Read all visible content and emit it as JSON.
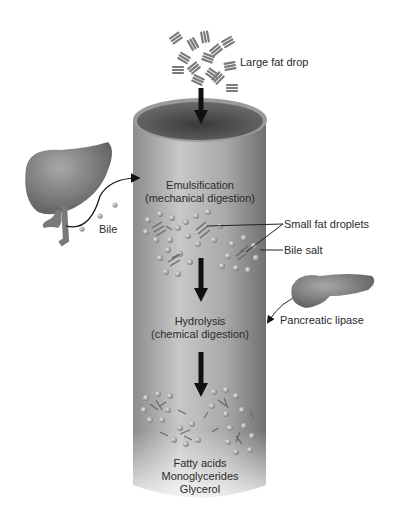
{
  "diagram": {
    "colors": {
      "tube_light": "#c4c4c4",
      "tube_dark": "#6e6e6e",
      "organ": "#8a8a8a",
      "arrow": "#111111",
      "text": "#2a2a2a"
    },
    "labels": {
      "large_fat_drop": "Large fat drop",
      "emulsification_line1": "Emulsification",
      "emulsification_line2": "(mechanical digestion)",
      "bile": "Bile",
      "small_fat_droplets": "Small fat droplets",
      "bile_salt": "Bile salt",
      "pancreatic_lipase": "Pancreatic lipase",
      "hydrolysis_line1": "Hydrolysis",
      "hydrolysis_line2": "(chemical digestion)",
      "products": [
        "Fatty acids",
        "Monoglycerides",
        "Glycerol"
      ]
    },
    "nodes": [
      {
        "id": "large-fat-drop",
        "label": "Large fat drop"
      },
      {
        "id": "liver",
        "label": "Liver (source of bile)"
      },
      {
        "id": "emulsification",
        "label": "Emulsification (mechanical digestion)"
      },
      {
        "id": "small-fat-droplets",
        "label": "Small fat droplets"
      },
      {
        "id": "pancreas",
        "label": "Pancreatic lipase"
      },
      {
        "id": "hydrolysis",
        "label": "Hydrolysis (chemical digestion)"
      },
      {
        "id": "products",
        "label": "Fatty acids, Monoglycerides, Glycerol"
      }
    ],
    "edges": [
      {
        "from": "large-fat-drop",
        "to": "emulsification"
      },
      {
        "from": "liver",
        "to": "emulsification",
        "label": "Bile"
      },
      {
        "from": "emulsification",
        "to": "small-fat-droplets"
      },
      {
        "from": "small-fat-droplets",
        "to": "hydrolysis"
      },
      {
        "from": "pancreas",
        "to": "hydrolysis"
      },
      {
        "from": "hydrolysis",
        "to": "products"
      }
    ]
  }
}
